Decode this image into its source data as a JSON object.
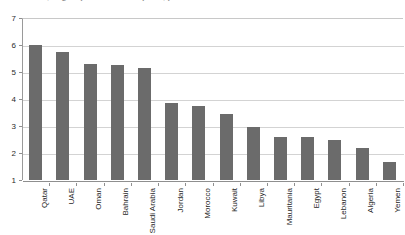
{
  "caption": {
    "text": "Individuals, in groups due to corruption, per 10"
  },
  "chart_data": {
    "type": "bar",
    "title": "",
    "subtitle": "",
    "xlabel": "",
    "ylabel": "",
    "ylim": [
      1,
      7
    ],
    "yticks": [
      1,
      2,
      3,
      4,
      5,
      6,
      7
    ],
    "ytick_labels": [
      "1",
      "2",
      "3",
      "4",
      "5",
      "6",
      "7"
    ],
    "grid": true,
    "legend": "none",
    "bar_color": "#6b6b6b",
    "categories": [
      "Qatar",
      "UAE",
      "Oman",
      "Bahrain",
      "Saudi Arabia",
      "Jordan",
      "Morocco",
      "Kuwait",
      "Libya",
      "Mauritania",
      "Egypt",
      "Lebanon",
      "Algeria",
      "Yemen"
    ],
    "values": [
      6.0,
      5.75,
      5.3,
      5.25,
      5.15,
      3.85,
      3.75,
      3.45,
      2.95,
      2.6,
      2.6,
      2.5,
      2.2,
      1.65
    ]
  }
}
